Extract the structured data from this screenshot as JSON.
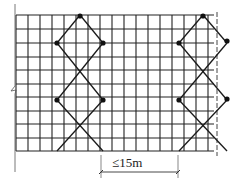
{
  "colors": {
    "line": "#1a1a1a",
    "grid": "#222222",
    "background": "#ffffff"
  },
  "grid": {
    "left": 16,
    "top": 15,
    "right": 214,
    "bottom": 151,
    "cols_x": [
      16,
      28,
      40,
      52,
      64,
      76,
      88,
      100,
      112,
      124,
      136,
      148,
      160,
      172,
      184,
      196,
      208
    ],
    "rows_y": [
      15,
      29,
      43,
      57,
      70,
      84,
      97,
      111,
      124,
      138,
      151
    ]
  },
  "left_edge": {
    "x": 15,
    "top": 4,
    "bottom": 172,
    "break_symbol": "zigzag",
    "break_y": 90
  },
  "right_edge": {
    "x": 217,
    "style": "dashed",
    "top": 12,
    "bottom": 156
  },
  "braces": [
    {
      "name": "left-brace",
      "top_x": 80,
      "half_w": 23,
      "rows": [
        15,
        43,
        70,
        100,
        124,
        151
      ]
    },
    {
      "name": "right-brace",
      "top_x": 203,
      "half_w": 24,
      "rows": [
        15,
        43,
        70,
        100,
        124,
        151
      ]
    }
  ],
  "nodes": [
    [
      80,
      16
    ],
    [
      57,
      43
    ],
    [
      103,
      43
    ],
    [
      57,
      100
    ],
    [
      103,
      100
    ],
    [
      203,
      16
    ],
    [
      179,
      43
    ],
    [
      227,
      41
    ],
    [
      179,
      100
    ],
    [
      227,
      99
    ]
  ],
  "dimension": {
    "label": "≤15m",
    "x1": 101,
    "x2": 178,
    "y": 172,
    "label_x": 112,
    "label_y": 160
  }
}
